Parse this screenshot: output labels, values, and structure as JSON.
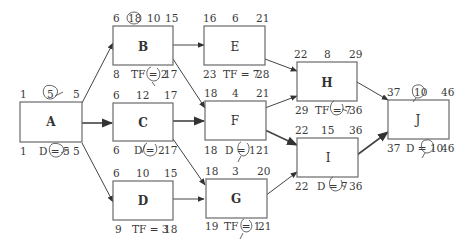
{
  "diagram": {
    "type": "activity-on-node network (critical path)",
    "nodes": [
      {
        "id": "A",
        "es": "1",
        "dur": "5",
        "ef": "5",
        "ls": "1",
        "bottom": "D = 5",
        "lf": "5",
        "dur_circled": true,
        "bottom_circled": true
      },
      {
        "id": "B",
        "es": "6",
        "dur": "18",
        "ef": "10",
        "ef2": "15",
        "ls": "8",
        "bottom": "TF = 2",
        "lf": "17",
        "dur_circled": true,
        "bottom_circled": true
      },
      {
        "id": "C",
        "es": "6",
        "dur": "12",
        "ef": "17",
        "ls": "6",
        "bottom": "D = 2",
        "lf": "17",
        "bottom_circled": true
      },
      {
        "id": "D",
        "es": "6",
        "dur": "10",
        "ef": "15",
        "ls": "9",
        "bottom": "TF = 3",
        "lf": "18"
      },
      {
        "id": "E",
        "es": "16",
        "dur": "6",
        "ef": "21",
        "ls": "23",
        "bottom": "TF = 7",
        "lf": "28"
      },
      {
        "id": "F",
        "es": "18",
        "dur": "4",
        "ef": "21",
        "ls": "18",
        "bottom": "D = 1",
        "lf": "21",
        "bottom_circled": true
      },
      {
        "id": "G",
        "es": "18",
        "dur": "3",
        "ef": "20",
        "ls": "19",
        "bottom": "TF = 1",
        "lf": "21",
        "bottom_circled": true
      },
      {
        "id": "H",
        "es": "22",
        "dur": "8",
        "ef": "29",
        "ls": "29",
        "bottom": "TF = 7",
        "lf": "36",
        "bottom_circled": true
      },
      {
        "id": "I",
        "es": "22",
        "dur": "15",
        "ef": "36",
        "ls": "22",
        "bottom": "D = 7",
        "lf": "36",
        "bottom_circled": true
      },
      {
        "id": "J",
        "es": "37",
        "dur": "10",
        "ef": "46",
        "ls": "37",
        "bottom": "D = 10",
        "lf": "46",
        "dur_circled": true,
        "bottom_circled": true
      }
    ],
    "edges": [
      [
        "A",
        "B"
      ],
      [
        "A",
        "C"
      ],
      [
        "A",
        "D"
      ],
      [
        "B",
        "E"
      ],
      [
        "B",
        "F"
      ],
      [
        "C",
        "F"
      ],
      [
        "C",
        "G"
      ],
      [
        "D",
        "G"
      ],
      [
        "E",
        "H"
      ],
      [
        "F",
        "H"
      ],
      [
        "F",
        "I"
      ],
      [
        "G",
        "I"
      ],
      [
        "H",
        "J"
      ],
      [
        "I",
        "J"
      ]
    ]
  },
  "labels": {
    "A": {
      "name": "A",
      "tl": "1",
      "tm": "5",
      "tr": "5",
      "bl": "1",
      "bm": "D = 5",
      "br": "5"
    },
    "B": {
      "name": "B",
      "tl": "6",
      "tm": "18",
      "tm2": "10",
      "tr": "15",
      "bl": "8",
      "bm": "TF = 2",
      "br": "17"
    },
    "C": {
      "name": "C",
      "tl": "6",
      "tm": "12",
      "tr": "17",
      "bl": "6",
      "bm": "D = 2",
      "br": "17"
    },
    "D": {
      "name": "D",
      "tl": "6",
      "tm": "10",
      "tr": "15",
      "bl": "9",
      "bm": "TF = 3",
      "br": "18"
    },
    "E": {
      "name": "E",
      "tl": "16",
      "tm": "6",
      "tr": "21",
      "bl": "23",
      "bm": "TF = 7",
      "br": "28"
    },
    "F": {
      "name": "F",
      "tl": "18",
      "tm": "4",
      "tr": "21",
      "bl": "18",
      "bm": "D = 1",
      "br": "21"
    },
    "G": {
      "name": "G",
      "tl": "18",
      "tm": "3",
      "tr": "20",
      "bl": "19",
      "bm": "TF = 1",
      "br": "21"
    },
    "H": {
      "name": "H",
      "tl": "22",
      "tm": "8",
      "tr": "29",
      "bl": "29",
      "bm": "TF = 7",
      "br": "36"
    },
    "I": {
      "name": "I",
      "tl": "22",
      "tm": "15",
      "tr": "36",
      "bl": "22",
      "bm": "D = 7",
      "br": "36"
    },
    "J": {
      "name": "J",
      "tl": "37",
      "tm": "10",
      "tr": "46",
      "bl": "37",
      "bm": "D = 10",
      "br": "46"
    }
  }
}
